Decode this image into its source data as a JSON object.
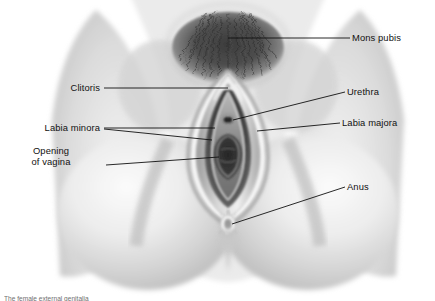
{
  "figure": {
    "style": "grayscale airbrush medical illustration",
    "background_color": "#ffffff",
    "line_color": "#111111",
    "label_color": "#111111"
  },
  "labels": {
    "mons_pubis": "Mons pubis",
    "clitoris": "Clitoris",
    "urethra": "Urethra",
    "labia_minora": "Labia minora",
    "labia_majora": "Labia majora",
    "opening_of_vagina_line1": "Opening",
    "opening_of_vagina_line2": "of vagina",
    "anus": "Anus"
  },
  "caption": {
    "text": "The female external genitalia"
  }
}
